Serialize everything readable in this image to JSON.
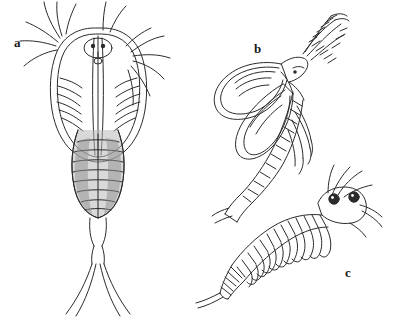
{
  "figure": {
    "type": "scientific-illustration-plate",
    "background_color": "#ffffff",
    "line_color": "#2b2b2b",
    "shading_color": "#9b9b9b",
    "panels": [
      {
        "id": "a",
        "label": "a",
        "label_position": {
          "x": 14,
          "y": 36
        },
        "subject": "notostracan-tadpole-shrimp-dorsal-view",
        "description": "Dorsal view of a tadpole shrimp with broad oval carapace, paired dorsal eyes, long antennae and two long caudal filaments"
      },
      {
        "id": "b",
        "label": "b",
        "label_position": {
          "x": 254,
          "y": 42
        },
        "subject": "clam-shrimp-lateral-view",
        "description": "Lateral view of a bivalved clam shrimp with large rounded carapace valve, feathered head appendage and segmented trunk limbs"
      },
      {
        "id": "c",
        "label": "c",
        "label_position": {
          "x": 345,
          "y": 266
        },
        "subject": "fairy-shrimp-lateral-view",
        "description": "Lateral view of a fairy shrimp with stalked eyes, series of leaf-like phyllopod limbs along the thorax and a long segmented abdomen ending in paired cercopods"
      }
    ]
  }
}
